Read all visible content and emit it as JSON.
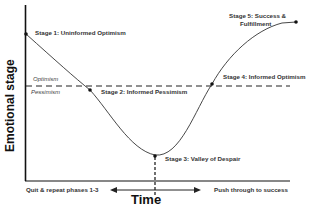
{
  "diagram": {
    "y_axis_label": "Emotional stage",
    "x_axis_label": "Time",
    "zones": {
      "above": "Optimism",
      "below": "Pessimism"
    },
    "stages": [
      {
        "id": 1,
        "label": "Stage 1: Uninformed Optimism"
      },
      {
        "id": 2,
        "label": "Stage 2: Informed Pessimism"
      },
      {
        "id": 3,
        "label": "Stage 3: Valley of Despair"
      },
      {
        "id": 4,
        "label": "Stage 4: Informed Optimism"
      },
      {
        "id": 5,
        "label_line1": "Stage 5: Success &",
        "label_line2": "Fulfillment"
      }
    ],
    "outcomes": {
      "left": "Quit & repeat phases 1-3",
      "right": "Push through to success"
    },
    "colors": {
      "line": "#333333",
      "axis": "#111111",
      "text": "#222222"
    }
  }
}
